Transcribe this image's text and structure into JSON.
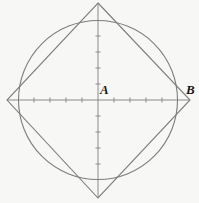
{
  "figure": {
    "kind": "geometry-diagram",
    "width": 199,
    "height": 203,
    "background_color": "#f7f7f5",
    "stroke_color": "#7d7d7d",
    "axis_color": "#8b8b8b",
    "label_color": "#161616",
    "labels": [
      {
        "id": "A",
        "text": "A",
        "role": "center-point-label",
        "x": 100,
        "y": 83
      },
      {
        "id": "B",
        "text": "B",
        "role": "right-vertex-label",
        "x": 186,
        "y": 83
      }
    ],
    "center": {
      "x": 98,
      "y": 100
    },
    "circle": {
      "name": "circle",
      "cx": 98,
      "cy": 100,
      "r": 79.5,
      "stroke_width": 1.1
    },
    "diamond": {
      "name": "rotated-square",
      "points": "98,3 190,100 98,198 7,100",
      "stroke_width": 1.1,
      "vertices": [
        {
          "name": "top",
          "x": 98,
          "y": 3
        },
        {
          "name": "right",
          "x": 190,
          "y": 100
        },
        {
          "name": "bottom",
          "x": 98,
          "y": 198
        },
        {
          "name": "left",
          "x": 7,
          "y": 100
        }
      ]
    },
    "axes": {
      "horizontal": {
        "x1": 7,
        "y1": 100,
        "x2": 190,
        "y2": 100,
        "stroke_width": 1
      },
      "vertical": {
        "x1": 98,
        "y1": 3,
        "x2": 98,
        "y2": 198,
        "stroke_width": 1
      },
      "tick_length": 5,
      "tick_spacing": 16,
      "horizontal_ticks": [
        34,
        50,
        66,
        82,
        114,
        130,
        146,
        162
      ],
      "vertical_ticks": [
        36,
        52,
        68,
        84,
        116,
        132,
        148,
        164
      ]
    }
  },
  "chart_data": {
    "type": "scatter",
    "title": "",
    "xlabel": "",
    "ylabel": "",
    "shapes": [
      {
        "name": "circle",
        "type": "circle",
        "center": [
          98,
          100
        ],
        "radius": 79.5
      },
      {
        "name": "rotated-square",
        "type": "polygon",
        "vertices": [
          [
            98,
            3
          ],
          [
            190,
            100
          ],
          [
            98,
            198
          ],
          [
            7,
            100
          ]
        ]
      }
    ],
    "points": [
      {
        "label": "A",
        "x": 98,
        "y": 100,
        "role": "center"
      },
      {
        "label": "B",
        "x": 190,
        "y": 100,
        "role": "vertex"
      }
    ],
    "axis_ranges": {
      "x": [
        7,
        190
      ],
      "y": [
        3,
        198
      ]
    },
    "grid": false,
    "legend": "none"
  }
}
